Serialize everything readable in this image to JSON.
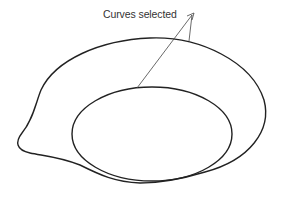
{
  "diagram": {
    "callout_label": "Curves selected",
    "stroke_color": "#222222",
    "callout_color": "#444444",
    "background": "#ffffff",
    "shapes": [
      {
        "name": "outer-curve",
        "type": "closed-spline"
      },
      {
        "name": "inner-ellipse",
        "type": "ellipse"
      }
    ]
  }
}
